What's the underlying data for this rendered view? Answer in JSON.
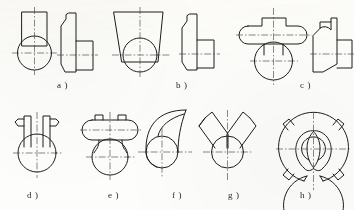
{
  "sheet": {
    "kind": "engineering-drawing-exercise-sheet",
    "width": 354,
    "height": 210,
    "background_color": "#fdfdfb",
    "ink_color": "#1d1d1d",
    "centerline_color": "#3a3a3a",
    "line_width_outline": 1.0,
    "line_width_centerline": 0.6,
    "centerline_dash": "7 2 1.5 2",
    "rows": 2,
    "figure_count": 8
  },
  "figures": [
    {
      "id": "a",
      "label": "a )",
      "label_x": 57,
      "label_y": 80,
      "row": 1,
      "description": "cylinder with rectangular boss - front view circle with rectangle on top, plus profile view",
      "views": [
        "front",
        "side"
      ]
    },
    {
      "id": "b",
      "label": "b )",
      "label_x": 176,
      "label_y": 80,
      "row": 1,
      "description": "tapered trapezoidal body over circle, plus profile view",
      "views": [
        "front",
        "side"
      ]
    },
    {
      "id": "c",
      "label": "c )",
      "label_x": 300,
      "label_y": 80,
      "row": 1,
      "description": "mushroom / T-head with rounded ends over circle, plus profile view",
      "views": [
        "front",
        "side"
      ]
    },
    {
      "id": "d",
      "label": "d )",
      "label_x": 27,
      "label_y": 190,
      "row": 2,
      "description": "circle with two vertical prongs each with outward tab",
      "views": [
        "front"
      ]
    },
    {
      "id": "e",
      "label": "e )",
      "label_x": 108,
      "label_y": 190,
      "row": 2,
      "description": "horizontal stadium head with two small tabs on a tapered neck over circle",
      "views": [
        "front"
      ]
    },
    {
      "id": "f",
      "label": "f )",
      "label_x": 172,
      "label_y": 190,
      "row": 2,
      "description": "hook / comma shaped curved tail rising from circle",
      "views": [
        "front"
      ]
    },
    {
      "id": "g",
      "label": "g )",
      "label_x": 228,
      "label_y": 190,
      "row": 2,
      "description": "Y shaped fork with two angled arms over circle",
      "views": [
        "front"
      ]
    },
    {
      "id": "h",
      "label": "h )",
      "label_x": 300,
      "label_y": 190,
      "row": 2,
      "description": "split ring with four lugs, two internal C slots and central bore",
      "views": [
        "front"
      ]
    }
  ]
}
